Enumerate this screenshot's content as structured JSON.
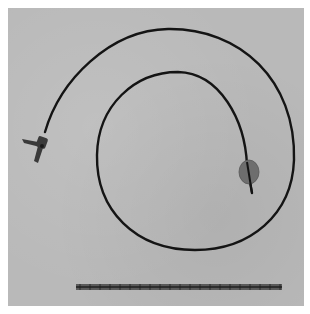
{
  "image": {
    "subject": "coiled catheter with balloon tip beside a ruler",
    "colors": {
      "background": "#b9b9b9",
      "catheter": "#141414",
      "balloon": "#6e6e6e",
      "ruler": "#4a4a4a",
      "margin": "#ffffff"
    },
    "objects": [
      {
        "name": "catheter-hub",
        "description": "T-shaped connector at proximal end"
      },
      {
        "name": "catheter-tubing",
        "description": "long dark tube coiled in a spiral"
      },
      {
        "name": "balloon-tip",
        "description": "oval inflated balloon near distal end"
      },
      {
        "name": "scale-ruler",
        "description": "measurement ruler along bottom"
      }
    ]
  }
}
